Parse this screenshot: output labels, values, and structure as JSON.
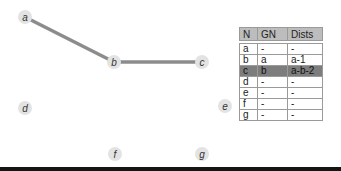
{
  "graph": {
    "nodes": [
      {
        "id": "a",
        "label": "a"
      },
      {
        "id": "b",
        "label": "b"
      },
      {
        "id": "c",
        "label": "c"
      },
      {
        "id": "d",
        "label": "d"
      },
      {
        "id": "e",
        "label": "e"
      },
      {
        "id": "f",
        "label": "f"
      },
      {
        "id": "g",
        "label": "g"
      }
    ],
    "edges": [
      {
        "from": "a",
        "to": "b"
      },
      {
        "from": "b",
        "to": "c"
      }
    ],
    "colors": {
      "node_fill": "#e3e3e3",
      "edge": "#8c8c8c",
      "highlight_row": "#7d7d7d",
      "header": "#bdbdbd"
    }
  },
  "table": {
    "headers": [
      "N",
      "GN",
      "Dists"
    ],
    "rows": [
      {
        "n": "a",
        "gn": "-",
        "dists": "-",
        "highlight": false
      },
      {
        "n": "b",
        "gn": "a",
        "dists": "a-1",
        "highlight": false
      },
      {
        "n": "c",
        "gn": "b",
        "dists": "a-b-2",
        "highlight": true
      },
      {
        "n": "d",
        "gn": "-",
        "dists": "-",
        "highlight": false
      },
      {
        "n": "e",
        "gn": "-",
        "dists": "-",
        "highlight": false
      },
      {
        "n": "f",
        "gn": "-",
        "dists": "-",
        "highlight": false
      },
      {
        "n": "g",
        "gn": "-",
        "dists": "-",
        "highlight": false
      }
    ]
  }
}
